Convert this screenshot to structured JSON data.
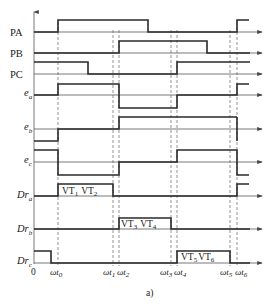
{
  "caption": "a)",
  "origin_label": "0",
  "signals": [
    {
      "id": "PA",
      "label": "PA",
      "italic": false,
      "sub": ""
    },
    {
      "id": "PB",
      "label": "PB",
      "italic": false,
      "sub": ""
    },
    {
      "id": "PC",
      "label": "PC",
      "italic": false,
      "sub": ""
    },
    {
      "id": "ea",
      "label": "e",
      "italic": true,
      "sub": "a"
    },
    {
      "id": "eb",
      "label": "e",
      "italic": true,
      "sub": "b"
    },
    {
      "id": "ec",
      "label": "e",
      "italic": true,
      "sub": "c"
    },
    {
      "id": "Dra",
      "label": "Dr",
      "italic": true,
      "sub": "a"
    },
    {
      "id": "Drb",
      "label": "Dr",
      "italic": true,
      "sub": "b"
    },
    {
      "id": "Drc",
      "label": "Dr",
      "italic": true,
      "sub": "c"
    }
  ],
  "time_marks": [
    {
      "label": "ωt",
      "sub": "0"
    },
    {
      "label": "ωt",
      "sub": "1"
    },
    {
      "label": "ωt",
      "sub": "2"
    },
    {
      "label": "ωt",
      "sub": "3"
    },
    {
      "label": "ωt",
      "sub": "4"
    },
    {
      "label": "ωt",
      "sub": "5"
    },
    {
      "label": "ωt",
      "sub": "6"
    }
  ],
  "pulse_labels": {
    "dra": {
      "a": "VT",
      "a_sub": "1",
      "b": "VT",
      "b_sub": "2"
    },
    "drb": {
      "a": "VT",
      "a_sub": "3",
      "b": "VT",
      "b_sub": "4"
    },
    "drc": {
      "a": "VT",
      "a_sub": "5",
      "b": "VT",
      "b_sub": "6"
    }
  }
}
